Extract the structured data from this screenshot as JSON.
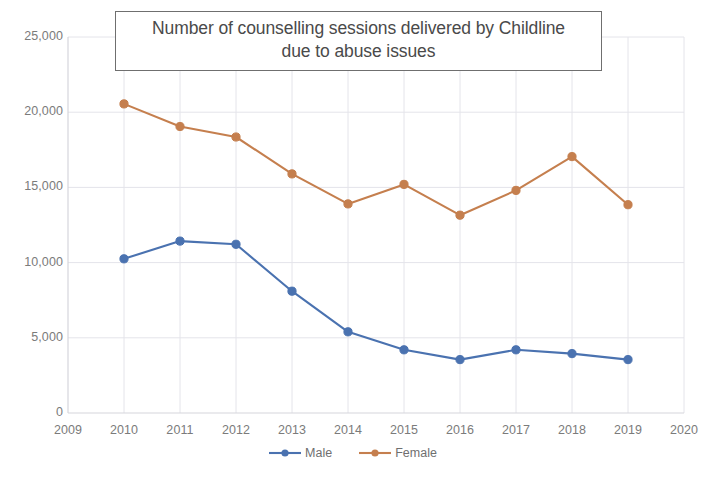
{
  "chart_data": {
    "type": "line",
    "title": "Number of counselling sessions delivered by Childline due to abuse issues",
    "title_line1": "Number of counselling sessions delivered by Childline",
    "title_line2": "due to abuse issues",
    "xlabel": "",
    "ylabel": "",
    "x": [
      2010,
      2011,
      2012,
      2013,
      2014,
      2015,
      2016,
      2017,
      2018,
      2019
    ],
    "xlim": [
      2009,
      2020
    ],
    "ylim": [
      0,
      25000
    ],
    "xticks": [
      "2009",
      "2010",
      "2011",
      "2012",
      "2013",
      "2014",
      "2015",
      "2016",
      "2017",
      "2018",
      "2019",
      "2020"
    ],
    "yticks": [
      "0",
      "5,000",
      "10,000",
      "15,000",
      "20,000",
      "25,000"
    ],
    "ytick_values": [
      0,
      5000,
      10000,
      15000,
      20000,
      25000
    ],
    "grid": true,
    "legend_position": "bottom",
    "series": [
      {
        "name": "Male",
        "color": "#4a72b0",
        "marker": "circle",
        "values": [
          10250,
          11430,
          11220,
          8100,
          5400,
          4200,
          3550,
          4200,
          3950,
          3550
        ]
      },
      {
        "name": "Female",
        "color": "#c57f4e",
        "marker": "circle",
        "values": [
          20550,
          19050,
          18350,
          15900,
          13900,
          15200,
          13150,
          14800,
          17050,
          13850
        ]
      }
    ]
  },
  "colors": {
    "male": "#4a72b0",
    "female": "#c57f4e",
    "grid": "#e4e4ea",
    "axis": "#d6d6dc",
    "tick_text": "#7b7b7b",
    "title_text": "#4a4a4a",
    "title_border": "#6f6f6f",
    "background": "#ffffff"
  }
}
